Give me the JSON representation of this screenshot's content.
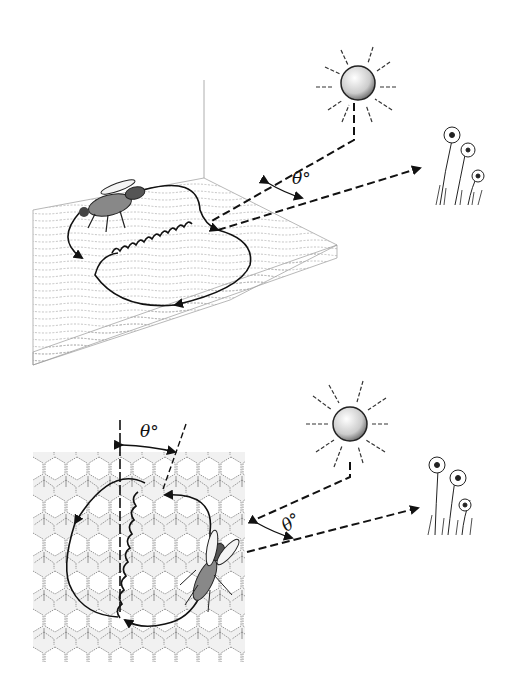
{
  "panels": [
    {
      "name": "horizontal-surface",
      "surface": "wooden board",
      "angle_label": "θ°",
      "elements": [
        "sun",
        "flowers",
        "bee",
        "waggle-run",
        "return-loops",
        "sun-direction-line",
        "food-direction-line"
      ]
    },
    {
      "name": "vertical-comb",
      "surface": "honeycomb",
      "angle_label_comb": "θ°",
      "angle_label_outside": "θ°",
      "elements": [
        "sun",
        "flowers",
        "bee",
        "waggle-run",
        "return-loops",
        "vertical-reference-line",
        "sun-direction-line",
        "food-direction-line"
      ]
    }
  ],
  "colors": {
    "ink": "#111111",
    "background": "#ffffff",
    "stipple": "#9a9a9a"
  }
}
